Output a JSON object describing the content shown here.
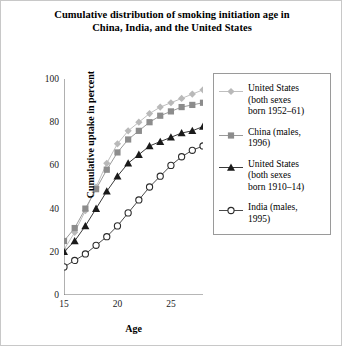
{
  "chart_data": {
    "type": "line",
    "title": "Cumulative distribution of smoking initiation age in China, India, and the United States",
    "title_lines": [
      "Cumulative distribution of smoking initiation age in",
      "China, India, and the United States"
    ],
    "xlabel": "Age",
    "ylabel": "Cumulative uptake in percent",
    "xlim": [
      15,
      28
    ],
    "ylim": [
      0,
      100
    ],
    "xticks": [
      15,
      20,
      25
    ],
    "yticks": [
      0,
      20,
      40,
      60,
      80,
      100
    ],
    "xticklabels": [
      "15",
      "20",
      "25"
    ],
    "yticklabels": [
      "0",
      "20",
      "40",
      "60",
      "80",
      "100"
    ],
    "grid": false,
    "legend_position": "right-outside",
    "x": [
      15,
      16,
      17,
      18,
      19,
      20,
      21,
      22,
      23,
      24,
      25,
      26,
      27,
      28
    ],
    "series": [
      {
        "name": "United States (both sexes born 1952–61)",
        "name_lines": [
          "United States",
          "(both sexes",
          "born 1952–61)"
        ],
        "marker": "diamond",
        "color": "#b9b9b9",
        "line_color": "#bfbfbf",
        "values": [
          21,
          29,
          39,
          50,
          61,
          70,
          76,
          80,
          84,
          87,
          89,
          91,
          93,
          95
        ]
      },
      {
        "name": "China (males, 1996)",
        "name_lines": [
          "China (males,",
          "1996)"
        ],
        "marker": "square",
        "color": "#8c8c8c",
        "line_color": "#9a9a9a",
        "values": [
          25,
          31,
          40,
          49,
          58,
          66,
          72,
          76,
          80,
          83,
          85,
          87,
          88,
          89
        ]
      },
      {
        "name": "United States (both sexes born 1910–14)",
        "name_lines": [
          "United States",
          "(both sexes",
          "born 1910–14)"
        ],
        "marker": "triangle",
        "color": "#1a1a1a",
        "line_color": "#3a3a3a",
        "values": [
          20,
          25,
          32,
          40,
          48,
          55,
          61,
          65,
          69,
          71,
          73,
          75,
          76,
          78
        ]
      },
      {
        "name": "India (males, 1995)",
        "name_lines": [
          "India (males,",
          "1995)"
        ],
        "marker": "circle-open",
        "color": "#2b2b2b",
        "line_color": "#4a4a4a",
        "values": [
          13,
          16,
          19,
          23,
          27,
          32,
          38,
          44,
          50,
          55,
          60,
          64,
          67,
          69
        ]
      }
    ]
  },
  "legend": {
    "entries": [
      {
        "label": "United States (both sexes born 1952–61)"
      },
      {
        "label": "China (males, 1996)"
      },
      {
        "label": "United States (both sexes born 1910–14)"
      },
      {
        "label": "India (males, 1995)"
      }
    ]
  }
}
